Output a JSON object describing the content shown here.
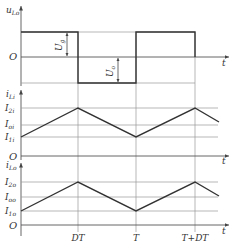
{
  "diagram": {
    "type": "waveform",
    "panels": [
      {
        "id": "voltage",
        "ylabel": "u",
        "ylabel_sub": "Lo",
        "origin_label": "O",
        "xlabel": "t",
        "waveform": "square",
        "dims": [
          {
            "label": "U",
            "sub": "g",
            "direction": "up"
          },
          {
            "label": "U",
            "sub": "o",
            "direction": "down"
          }
        ]
      },
      {
        "id": "input-current",
        "ylabel": "i",
        "ylabel_sub": "Li",
        "origin_label": "O",
        "xlabel": "t",
        "waveform": "triangle",
        "levels": [
          {
            "label": "I",
            "sub": "2i"
          },
          {
            "label": "I",
            "sub": "oi"
          },
          {
            "label": "I",
            "sub": "1i"
          }
        ]
      },
      {
        "id": "output-current",
        "ylabel": "i",
        "ylabel_sub": "Lo",
        "origin_label": "O",
        "xlabel": "t",
        "waveform": "triangle",
        "levels": [
          {
            "label": "I",
            "sub": "2o"
          },
          {
            "label": "I",
            "sub": "oo"
          },
          {
            "label": "I",
            "sub": "1o"
          }
        ]
      }
    ],
    "time_ticks": [
      "DT",
      "T",
      "T+DT"
    ],
    "colors": {
      "wave": "#333333",
      "axis": "#555555",
      "grid": "#999999"
    }
  }
}
